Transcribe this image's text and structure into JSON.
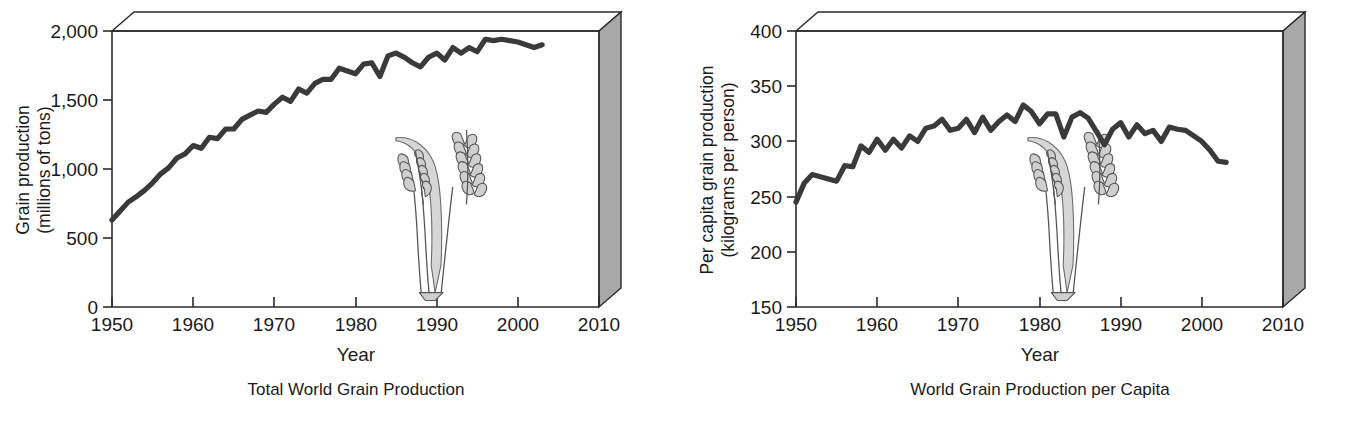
{
  "figure": {
    "background_color": "#ffffff",
    "line_color": "#3a3a3a",
    "box_side_color": "#a8a8a8",
    "wheat_color": "#cfcfcf"
  },
  "panels": [
    {
      "key": "total",
      "caption": "Total World Grain Production",
      "xlabel": "Year",
      "ylabel_line1": "Grain production",
      "ylabel_line2": "(millions of tons)",
      "xticks": [
        "1950",
        "1960",
        "1970",
        "1980",
        "1990",
        "2000",
        "2010"
      ],
      "yticks": [
        "0",
        "500",
        "1,000",
        "1,500",
        "2,000"
      ]
    },
    {
      "key": "percapita",
      "caption": "World Grain Production per Capita",
      "xlabel": "Year",
      "ylabel_line1": "Per capita grain production",
      "ylabel_line2": "(kilograms per person)",
      "xticks": [
        "1950",
        "1960",
        "1970",
        "1980",
        "1990",
        "2000",
        "2010"
      ],
      "yticks": [
        "150",
        "200",
        "250",
        "300",
        "350",
        "400"
      ]
    }
  ],
  "chart_data": [
    {
      "type": "line",
      "title": "Total World Grain Production",
      "xlabel": "Year",
      "ylabel": "Grain production (millions of tons)",
      "xlim": [
        1950,
        2010
      ],
      "ylim": [
        0,
        2000
      ],
      "xticks": [
        1950,
        1960,
        1970,
        1980,
        1990,
        2000,
        2010
      ],
      "yticks": [
        0,
        500,
        1000,
        1500,
        2000
      ],
      "grid": false,
      "legend": "none",
      "x": [
        1950,
        1951,
        1952,
        1953,
        1954,
        1955,
        1956,
        1957,
        1958,
        1959,
        1960,
        1961,
        1962,
        1963,
        1964,
        1965,
        1966,
        1967,
        1968,
        1969,
        1970,
        1971,
        1972,
        1973,
        1974,
        1975,
        1976,
        1977,
        1978,
        1979,
        1980,
        1981,
        1982,
        1983,
        1984,
        1985,
        1986,
        1987,
        1988,
        1989,
        1990,
        1991,
        1992,
        1993,
        1994,
        1995,
        1996,
        1997,
        1998,
        1999,
        2000,
        2001,
        2002,
        2003
      ],
      "values": [
        631,
        695,
        760,
        800,
        845,
        900,
        965,
        1010,
        1080,
        1110,
        1170,
        1150,
        1230,
        1220,
        1290,
        1290,
        1360,
        1390,
        1420,
        1410,
        1470,
        1520,
        1490,
        1580,
        1550,
        1620,
        1650,
        1650,
        1730,
        1710,
        1690,
        1760,
        1770,
        1670,
        1820,
        1840,
        1810,
        1770,
        1740,
        1810,
        1840,
        1790,
        1880,
        1840,
        1880,
        1850,
        1940,
        1930,
        1940,
        1930,
        1920,
        1900,
        1880,
        1900
      ]
    },
    {
      "type": "line",
      "title": "World Grain Production per Capita",
      "xlabel": "Year",
      "ylabel": "Per capita grain production (kilograms per person)",
      "xlim": [
        1950,
        2010
      ],
      "ylim": [
        150,
        400
      ],
      "xticks": [
        1950,
        1960,
        1970,
        1980,
        1990,
        2000,
        2010
      ],
      "yticks": [
        150,
        200,
        250,
        300,
        350,
        400
      ],
      "grid": false,
      "legend": "none",
      "x": [
        1950,
        1951,
        1952,
        1953,
        1954,
        1955,
        1956,
        1957,
        1958,
        1959,
        1960,
        1961,
        1962,
        1963,
        1964,
        1965,
        1966,
        1967,
        1968,
        1969,
        1970,
        1971,
        1972,
        1973,
        1974,
        1975,
        1976,
        1977,
        1978,
        1979,
        1980,
        1981,
        1982,
        1983,
        1984,
        1985,
        1986,
        1987,
        1988,
        1989,
        1990,
        1991,
        1992,
        1993,
        1994,
        1995,
        1996,
        1997,
        1998,
        1999,
        2000,
        2001,
        2002,
        2003
      ],
      "values": [
        245,
        262,
        270,
        268,
        266,
        264,
        278,
        277,
        296,
        290,
        302,
        292,
        302,
        294,
        305,
        300,
        312,
        314,
        320,
        310,
        312,
        320,
        308,
        322,
        310,
        318,
        324,
        318,
        333,
        327,
        316,
        325,
        325,
        304,
        322,
        326,
        321,
        309,
        297,
        311,
        317,
        304,
        315,
        307,
        310,
        300,
        313,
        311,
        310,
        305,
        300,
        292,
        282,
        281,
        272,
        265
      ]
    }
  ]
}
